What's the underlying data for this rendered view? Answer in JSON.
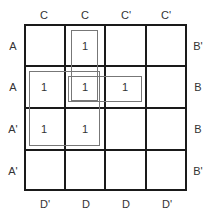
{
  "kmap": {
    "column_labels_top": [
      "C",
      "C",
      "C'",
      "C'"
    ],
    "column_labels_bottom": [
      "D'",
      "D",
      "D",
      "D'"
    ],
    "row_labels_left": [
      "A",
      "A",
      "A'",
      "A'"
    ],
    "row_labels_right": [
      "B'",
      "B",
      "B",
      "B'"
    ],
    "cells": [
      [
        "",
        "1",
        "",
        ""
      ],
      [
        "1",
        "1",
        "1",
        ""
      ],
      [
        "1",
        "1",
        "",
        ""
      ],
      [
        "",
        "",
        "",
        ""
      ]
    ],
    "groups": [
      {
        "name": "vertical-pair",
        "rows": [
          0,
          1
        ],
        "cols": [
          1
        ]
      },
      {
        "name": "square-quad",
        "rows": [
          1,
          2
        ],
        "cols": [
          0,
          1
        ]
      },
      {
        "name": "horizontal-pair",
        "rows": [
          1
        ],
        "cols": [
          1,
          2
        ]
      }
    ],
    "colors": {
      "grid": "#1a1a1a",
      "group": "#777777"
    }
  }
}
